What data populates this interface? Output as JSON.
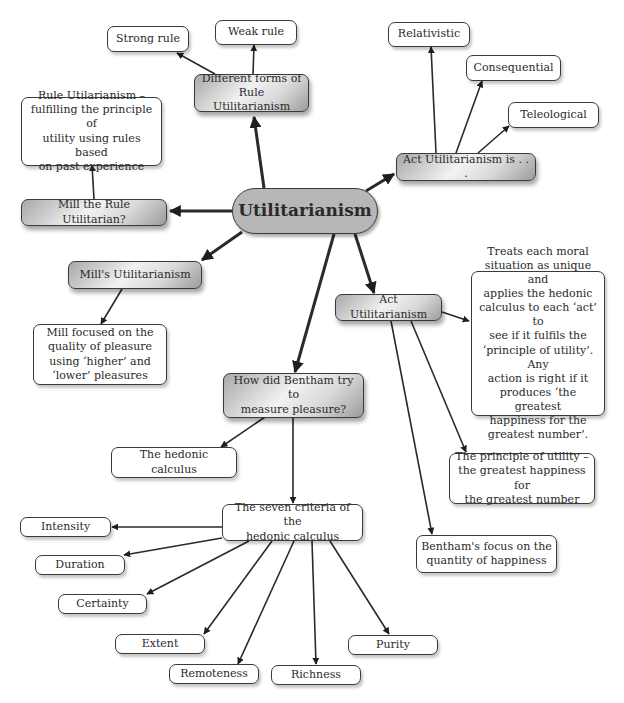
{
  "diagram": {
    "type": "concept-map",
    "colors": {
      "central_fill": "#b7b7b7",
      "branch_fill": "#d9d9d9",
      "leaf_fill": "#ffffff",
      "stroke": "#2a2a2a"
    },
    "nodes": {
      "utilitarianism": "Utilitarianism",
      "different_forms": "Different forms of\nRule Utilitarianism",
      "strong_rule": "Strong rule",
      "weak_rule": "Weak rule",
      "rule_util_def": "Rule Utilarianism –\nfulfilling the principle of\nutility using rules based\non past experience",
      "mill_rule": "Mill the Rule Utilitarian?",
      "mills_util": "Mill's Utilitarianism",
      "mill_focus": "Mill focused on the\nquality of pleasure\nusing ‘higher’ and\n‘lower’ pleasures",
      "act_util_is": "Act Utilitarianism is . . .",
      "relativistic": "Relativistic",
      "consequential": "Consequential",
      "teleological": "Teleological",
      "act_util": "Act Utilitarianism",
      "act_util_def": "Treats each moral\nsituation as unique and\napplies the hedonic\ncalculus to each ‘act’ to\nsee if it fulfils the\n‘principle of utility’. Any\naction is right if it\nproduces ‘the greatest\nhappiness for the\ngreatest number’.",
      "principle_utility": "The principle of utility –\nthe greatest happiness for\nthe greatest number",
      "bentham_focus": "Bentham's focus on the\nquantity of happiness",
      "bentham_measure": "How did Bentham try to\nmeasure pleasure?",
      "hedonic_calculus": "The hedonic calculus",
      "seven_criteria": "The seven criteria of the\nhedonic calculus",
      "intensity": "Intensity",
      "duration": "Duration",
      "certainty": "Certainty",
      "extent": "Extent",
      "remoteness": "Remoteness",
      "richness": "Richness",
      "purity": "Purity"
    },
    "edges": [
      [
        "utilitarianism",
        "different_forms"
      ],
      [
        "different_forms",
        "strong_rule"
      ],
      [
        "different_forms",
        "weak_rule"
      ],
      [
        "utilitarianism",
        "mill_rule"
      ],
      [
        "mill_rule",
        "rule_util_def"
      ],
      [
        "utilitarianism",
        "mills_util"
      ],
      [
        "mills_util",
        "mill_focus"
      ],
      [
        "utilitarianism",
        "act_util_is"
      ],
      [
        "act_util_is",
        "relativistic"
      ],
      [
        "act_util_is",
        "consequential"
      ],
      [
        "act_util_is",
        "teleological"
      ],
      [
        "utilitarianism",
        "act_util"
      ],
      [
        "act_util",
        "act_util_def"
      ],
      [
        "act_util",
        "principle_utility"
      ],
      [
        "act_util",
        "bentham_focus"
      ],
      [
        "utilitarianism",
        "bentham_measure"
      ],
      [
        "bentham_measure",
        "hedonic_calculus"
      ],
      [
        "bentham_measure",
        "seven_criteria"
      ],
      [
        "seven_criteria",
        "intensity"
      ],
      [
        "seven_criteria",
        "duration"
      ],
      [
        "seven_criteria",
        "certainty"
      ],
      [
        "seven_criteria",
        "extent"
      ],
      [
        "seven_criteria",
        "remoteness"
      ],
      [
        "seven_criteria",
        "richness"
      ],
      [
        "seven_criteria",
        "purity"
      ]
    ]
  }
}
